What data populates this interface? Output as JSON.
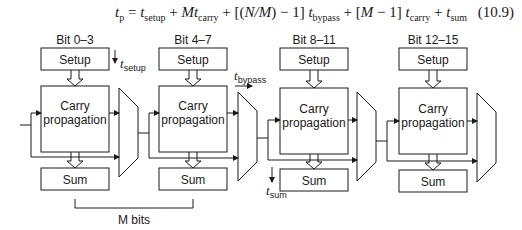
{
  "equation": {
    "lhs": "t",
    "lhs_sub": "p",
    "eq": " = ",
    "t1": "t",
    "t1_sub": "setup",
    "plus1": " + ",
    "t2_coef": "Mt",
    "t2_sub": "carry",
    "plus2": " + [(",
    "n_over_m": "N/M",
    "minus1": ") − 1] ",
    "t3": "t",
    "t3_sub": "bypass",
    "plus3": " + [",
    "m": "M",
    "minus2": " − 1] ",
    "t4": "t",
    "t4_sub": "carry",
    "plus4": " + ",
    "t5": "t",
    "t5_sub": "sum",
    "number": "(10.9)"
  },
  "blocks": [
    {
      "title": "Bit 0–3",
      "setup": "Setup",
      "carry_line1": "Carry",
      "carry_line2": "propagation",
      "sum": "Sum"
    },
    {
      "title": "Bit 4–7",
      "setup": "Setup",
      "carry_line1": "Carry",
      "carry_line2": "propagation",
      "sum": "Sum"
    },
    {
      "title": "Bit 8–11",
      "setup": "Setup",
      "carry_line1": "Carry",
      "carry_line2": "propagation",
      "sum": "Sum"
    },
    {
      "title": "Bit 12–15",
      "setup": "Setup",
      "carry_line1": "Carry",
      "carry_line2": "propagation",
      "sum": "Sum"
    }
  ],
  "annotations": {
    "t_setup": {
      "t": "t",
      "sub": "setup"
    },
    "t_bypass": {
      "t": "t",
      "sub": "bypass"
    },
    "t_sum": {
      "t": "t",
      "sub": "sum"
    },
    "m_bits": "M bits"
  }
}
